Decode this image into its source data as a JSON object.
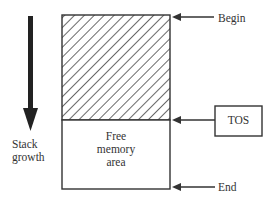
{
  "diagram": {
    "title": "",
    "stack_growth_label_line1": "Stack",
    "stack_growth_label_line2": "growth",
    "free_area_line1": "Free",
    "free_area_line2": "memory",
    "free_area_line3": "area",
    "pointers": {
      "begin": "Begin",
      "tos": "TOS",
      "end": "End"
    },
    "colors": {
      "stroke": "#333333",
      "hatch": "#444444",
      "background": "#ffffff"
    }
  }
}
